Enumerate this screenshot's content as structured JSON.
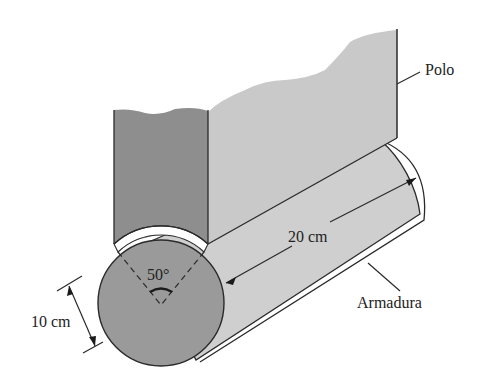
{
  "figure": {
    "type": "machine-geometry-diagram",
    "labels": {
      "pole": "Polo",
      "armature": "Armadura",
      "length": "20 cm",
      "diameter": "10 cm",
      "angle": "50°"
    },
    "colors": {
      "pole_dark_face": "#8e8e8e",
      "pole_light_face": "#c9c9c9",
      "cylinder_body": "#cfcfcf",
      "cylinder_end": "#9a9a9a",
      "outline": "#2a2a2a",
      "background": "#ffffff"
    }
  }
}
